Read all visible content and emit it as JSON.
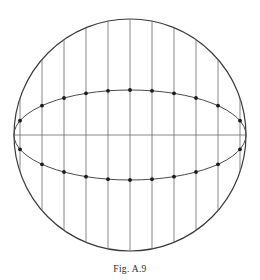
{
  "figure": {
    "caption": "Fig. A.9",
    "caption_y": 264,
    "canvas": {
      "width": 260,
      "height": 280
    },
    "colors": {
      "background": "#ffffff",
      "outline": "#3a3a3a",
      "chord": "#6b6b6b",
      "ellipse": "#4a4a4a",
      "axis": "#6b6b6b",
      "dot": "#1a1a1a",
      "caption": "#2b2b2b"
    },
    "stroke_widths": {
      "outline": 1.2,
      "chord": 0.8,
      "ellipse": 1.0,
      "axis": 0.8
    },
    "sphere": {
      "name": "great-circle-outline",
      "cx": 130,
      "cy": 135,
      "r": 116
    },
    "equator_ellipse": {
      "name": "equator-ellipse",
      "cx": 130,
      "cy": 135,
      "rx": 116,
      "ry": 45
    },
    "horizontal_axis": {
      "name": "horizontal-diameter",
      "x1": 14,
      "y1": 135,
      "x2": 246,
      "y2": 135
    },
    "vertical_chords_x": [
      20,
      42,
      64,
      86,
      108,
      130,
      152,
      174,
      196,
      218,
      240
    ],
    "dot_radius": 1.9,
    "dot_count_upper": 11,
    "dot_count_lower": 11
  }
}
